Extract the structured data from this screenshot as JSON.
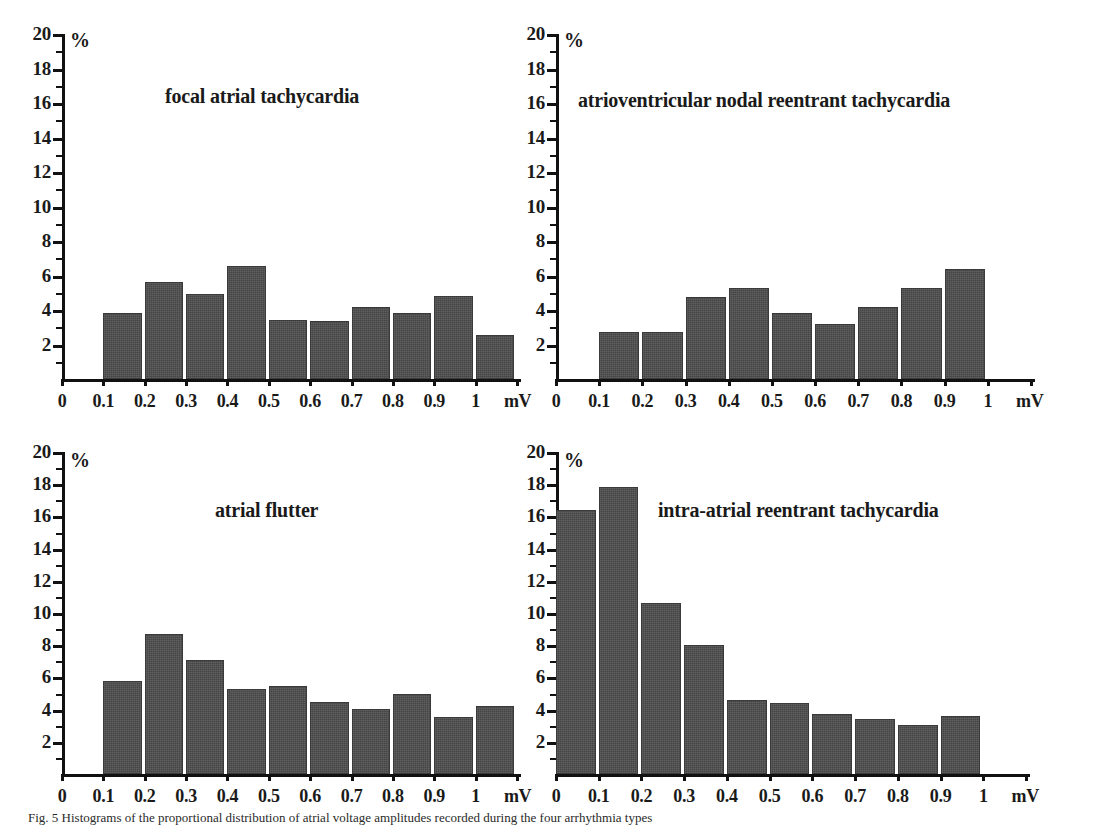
{
  "figure": {
    "caption": "Fig. 5  Histograms of the proportional distribution of atrial voltage amplitudes recorded during the four arrhythmia types",
    "bar_color": "#4d4d4d",
    "axis_color": "#111111",
    "y_unit": "%",
    "x_unit": "mV"
  },
  "chart_data": [
    {
      "type": "bar",
      "title": "focal atrial tachycardia",
      "xlabel": "mV",
      "ylabel": "%",
      "ylim": [
        0,
        20
      ],
      "xlim": [
        0,
        1.1
      ],
      "ytick_labels": [
        "2",
        "4",
        "6",
        "8",
        "10",
        "12",
        "14",
        "16",
        "18",
        "20"
      ],
      "ytick_values": [
        2,
        4,
        6,
        8,
        10,
        12,
        14,
        16,
        18,
        20
      ],
      "xtick_labels": [
        "0",
        "0.1",
        "0.2",
        "0.3",
        "0.4",
        "0.5",
        "0.6",
        "0.7",
        "0.8",
        "0.9",
        "1"
      ],
      "xtick_values": [
        0,
        0.1,
        0.2,
        0.3,
        0.4,
        0.5,
        0.6,
        0.7,
        0.8,
        0.9,
        1
      ],
      "bin_edges": [
        0.1,
        0.2,
        0.3,
        0.4,
        0.5,
        0.6,
        0.7,
        0.8,
        0.9,
        1.0,
        1.1
      ],
      "categories": [
        "0.1-0.2",
        "0.2-0.3",
        "0.3-0.4",
        "0.4-0.5",
        "0.5-0.6",
        "0.6-0.7",
        "0.7-0.8",
        "0.8-0.9",
        "0.9-1",
        "1-1.1"
      ],
      "values": [
        3.8,
        5.6,
        4.95,
        6.55,
        3.45,
        3.35,
        4.15,
        3.8,
        4.8,
        2.55
      ],
      "grid": false,
      "legend": "none"
    },
    {
      "type": "bar",
      "title": "atrioventricular nodal reentrant tachycardia",
      "xlabel": "mV",
      "ylabel": "%",
      "ylim": [
        0,
        20
      ],
      "xlim": [
        0,
        1.1
      ],
      "ytick_labels": [
        "2",
        "4",
        "6",
        "8",
        "10",
        "12",
        "14",
        "16",
        "18",
        "20"
      ],
      "ytick_values": [
        2,
        4,
        6,
        8,
        10,
        12,
        14,
        16,
        18,
        20
      ],
      "xtick_labels": [
        "0",
        "0.1",
        "0.2",
        "0.3",
        "0.4",
        "0.5",
        "0.6",
        "0.7",
        "0.8",
        "0.9",
        "1"
      ],
      "xtick_values": [
        0,
        0.1,
        0.2,
        0.3,
        0.4,
        0.5,
        0.6,
        0.7,
        0.8,
        0.9,
        1
      ],
      "bin_edges": [
        0.1,
        0.2,
        0.3,
        0.4,
        0.5,
        0.6,
        0.7,
        0.8,
        0.9,
        1.0,
        1.1
      ],
      "categories": [
        "0.1-0.2",
        "0.2-0.3",
        "0.3-0.4",
        "0.4-0.5",
        "0.5-0.6",
        "0.6-0.7",
        "0.7-0.8",
        "0.8-0.9",
        "0.9-1",
        "1-1.1"
      ],
      "values": [
        2.7,
        2.75,
        4.75,
        5.25,
        3.8,
        3.2,
        4.15,
        5.3,
        6.35,
        0
      ],
      "grid": false,
      "legend": "none"
    },
    {
      "type": "bar",
      "title": "atrial flutter",
      "xlabel": "mV",
      "ylabel": "%",
      "ylim": [
        0,
        20
      ],
      "xlim": [
        0,
        1.1
      ],
      "ytick_labels": [
        "2",
        "4",
        "6",
        "8",
        "10",
        "12",
        "14",
        "16",
        "18",
        "20"
      ],
      "ytick_values": [
        2,
        4,
        6,
        8,
        10,
        12,
        14,
        16,
        18,
        20
      ],
      "xtick_labels": [
        "0",
        "0.1",
        "0.2",
        "0.3",
        "0.4",
        "0.5",
        "0.6",
        "0.7",
        "0.8",
        "0.9",
        "1"
      ],
      "xtick_values": [
        0,
        0.1,
        0.2,
        0.3,
        0.4,
        0.5,
        0.6,
        0.7,
        0.8,
        0.9,
        1
      ],
      "bin_edges": [
        0.1,
        0.2,
        0.3,
        0.4,
        0.5,
        0.6,
        0.7,
        0.8,
        0.9,
        1.0,
        1.1
      ],
      "categories": [
        "0.1-0.2",
        "0.2-0.3",
        "0.3-0.4",
        "0.4-0.5",
        "0.5-0.6",
        "0.6-0.7",
        "0.7-0.8",
        "0.8-0.9",
        "0.9-1",
        "1-1.1"
      ],
      "values": [
        5.8,
        8.7,
        7.1,
        5.25,
        5.45,
        4.5,
        4.05,
        4.95,
        3.55,
        4.25
      ],
      "grid": false,
      "legend": "none"
    },
    {
      "type": "bar",
      "title": "intra-atrial reentrant tachycardia",
      "xlabel": "mV",
      "ylabel": "%",
      "ylim": [
        0,
        20
      ],
      "xlim": [
        0,
        1.1
      ],
      "ytick_labels": [
        "2",
        "4",
        "6",
        "8",
        "10",
        "12",
        "14",
        "16",
        "18",
        "20"
      ],
      "ytick_values": [
        2,
        4,
        6,
        8,
        10,
        12,
        14,
        16,
        18,
        20
      ],
      "xtick_labels": [
        "0",
        "0.1",
        "0.2",
        "0.3",
        "0.4",
        "0.5",
        "0.6",
        "0.7",
        "0.8",
        "0.9",
        "1"
      ],
      "xtick_values": [
        0,
        0.1,
        0.2,
        0.3,
        0.4,
        0.5,
        0.6,
        0.7,
        0.8,
        0.9,
        1
      ],
      "bin_edges": [
        0.0,
        0.1,
        0.2,
        0.3,
        0.4,
        0.5,
        0.6,
        0.7,
        0.8,
        0.9,
        1.0
      ],
      "categories": [
        "0-0.1",
        "0.1-0.2",
        "0.2-0.3",
        "0.3-0.4",
        "0.4-0.5",
        "0.5-0.6",
        "0.6-0.7",
        "0.7-0.8",
        "0.8-0.9",
        "0.9-1"
      ],
      "values": [
        16.4,
        17.8,
        10.6,
        8.0,
        4.6,
        4.4,
        3.75,
        3.4,
        3.05,
        3.6
      ],
      "grid": false,
      "legend": "none"
    }
  ]
}
